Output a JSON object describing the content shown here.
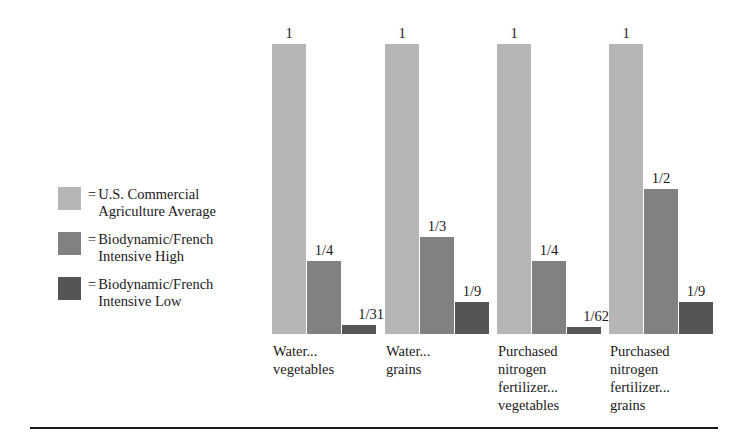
{
  "legend": {
    "equals_sign": "=",
    "items": [
      {
        "label": "U.S. Commercial\nAgriculture Average",
        "color": "#b6b6b6",
        "swatch_name": "legend-swatch-us-commercial"
      },
      {
        "label": "Biodynamic/French\nIntensive High",
        "color": "#818181",
        "swatch_name": "legend-swatch-bd-high"
      },
      {
        "label": "Biodynamic/French\nIntensive Low",
        "color": "#555555",
        "swatch_name": "legend-swatch-bd-low"
      }
    ]
  },
  "chart_data": {
    "type": "bar",
    "title": "",
    "xlabel": "",
    "ylabel": "",
    "ylim": [
      0,
      1
    ],
    "grid": false,
    "legend_position": "left",
    "categories": [
      "Water...\nvegetables",
      "Water...\ngrains",
      "Purchased\nnitrogen\nfertilizer...\nvegetables",
      "Purchased\nnitrogen\nfertilizer...\ngrains"
    ],
    "series": [
      {
        "name": "U.S. Commercial Agriculture Average",
        "color": "#b6b6b6",
        "labels": [
          "1",
          "1",
          "1",
          "1"
        ],
        "values": [
          1,
          1,
          1,
          1
        ]
      },
      {
        "name": "Biodynamic/French Intensive High",
        "color": "#818181",
        "labels": [
          "1/4",
          "1/3",
          "1/4",
          "1/2"
        ],
        "values": [
          0.25,
          0.3333,
          0.25,
          0.5
        ]
      },
      {
        "name": "Biodynamic/French Intensive Low",
        "color": "#555555",
        "labels": [
          "1/31",
          "1/9",
          "1/62",
          "1/9"
        ],
        "values": [
          0.0323,
          0.1111,
          0.0161,
          0.1111
        ]
      }
    ]
  }
}
